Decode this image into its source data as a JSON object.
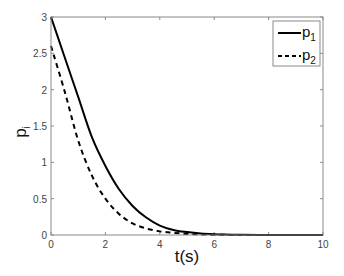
{
  "chart_data": {
    "type": "line",
    "title": "",
    "xlabel": "t(s)",
    "ylabel": "p_i",
    "xlim": [
      0,
      10
    ],
    "ylim": [
      0,
      3
    ],
    "xticks": [
      0,
      2,
      4,
      6,
      8,
      10
    ],
    "yticks": [
      0,
      0.5,
      1,
      1.5,
      2,
      2.5,
      3
    ],
    "xtick_labels": [
      "0",
      "2",
      "4",
      "6",
      "8",
      "10"
    ],
    "ytick_labels": [
      "0",
      "0.5",
      "1",
      "1.5",
      "2",
      "2.5",
      "3"
    ],
    "grid": false,
    "legend_position": "upper right",
    "x": [
      0,
      0.5,
      1,
      1.5,
      2,
      2.5,
      3,
      3.5,
      4,
      4.5,
      5,
      5.5,
      6,
      6.5,
      7,
      8,
      9,
      10
    ],
    "series": [
      {
        "name": "p1",
        "label_main": "p",
        "label_sub": "1",
        "style": "solid",
        "color": "#000000",
        "values": [
          3.0,
          2.45,
          1.9,
          1.35,
          0.95,
          0.63,
          0.4,
          0.24,
          0.13,
          0.07,
          0.04,
          0.02,
          0.01,
          0.005,
          0.002,
          0.0,
          0.0,
          0.0
        ]
      },
      {
        "name": "p2",
        "label_main": "p",
        "label_sub": "2",
        "style": "dashed",
        "color": "#000000",
        "values": [
          2.6,
          1.98,
          1.3,
          0.82,
          0.5,
          0.29,
          0.16,
          0.09,
          0.05,
          0.03,
          0.015,
          0.008,
          0.004,
          0.002,
          0.001,
          0.0,
          0.0,
          0.0
        ]
      }
    ]
  },
  "labels": {
    "xlabel": "t(s)",
    "ylabel_main": "p",
    "ylabel_sub": "i"
  }
}
